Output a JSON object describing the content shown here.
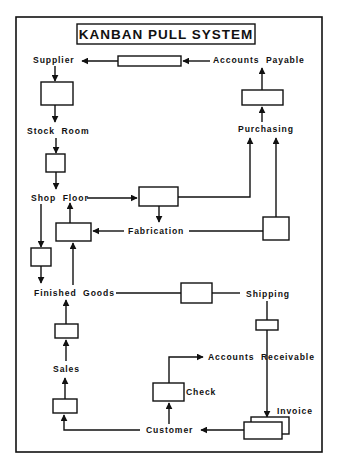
{
  "title": "KANBAN PULL SYSTEM",
  "nodes": {
    "supplier": "Supplier",
    "accounts_payable": "Accounts  Payable",
    "stock_room": "Stock  Room",
    "purchasing": "Purchasing",
    "shop_floor": "Shop  Floor",
    "fabrication": "Fabrication",
    "finished_goods": "Finished  Goods",
    "shipping": "Shipping",
    "accounts_receivable": "Accounts  Receivable",
    "sales": "Sales",
    "check": "Check",
    "invoice": "Invoice",
    "customer": "Customer"
  },
  "colors": {
    "ink": "#111111",
    "background": "#ffffff"
  }
}
